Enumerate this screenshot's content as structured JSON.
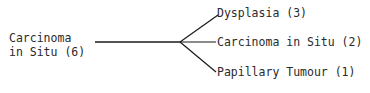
{
  "source": {
    "line1": "Carcinoma",
    "line2": "in Situ (6)"
  },
  "outcomes": [
    {
      "label": "Dysplasia (3)"
    },
    {
      "label": "Carcinoma in Situ (2)"
    },
    {
      "label": "Papillary Tumour (1)"
    }
  ],
  "colors": {
    "line": "#1a1a1a",
    "text": "#2a2a2a"
  }
}
